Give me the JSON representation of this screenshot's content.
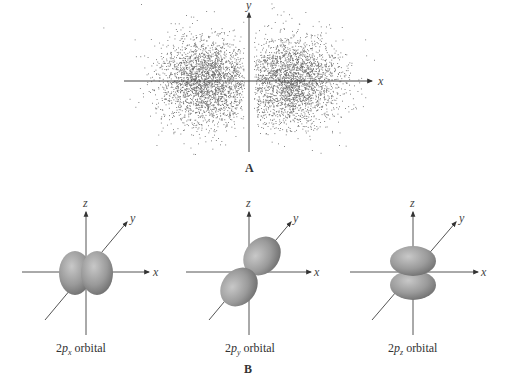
{
  "panel_a": {
    "label": "A",
    "axes": {
      "x": "x",
      "y": "y"
    },
    "description": "Electron density dot plot of a 2p orbital along x-axis"
  },
  "panel_b": {
    "label": "B",
    "orbitals": [
      {
        "name": "2px",
        "caption_prefix": "2",
        "caption_p": "p",
        "caption_sub": "x",
        "caption_suffix": " orbital",
        "axes": {
          "x": "x",
          "y": "y",
          "z": "z"
        }
      },
      {
        "name": "2py",
        "caption_prefix": "2",
        "caption_p": "p",
        "caption_sub": "y",
        "caption_suffix": " orbital",
        "axes": {
          "x": "x",
          "y": "y",
          "z": "z"
        }
      },
      {
        "name": "2pz",
        "caption_prefix": "2",
        "caption_p": "p",
        "caption_sub": "z",
        "caption_suffix": " orbital",
        "axes": {
          "x": "x",
          "y": "y",
          "z": "z"
        }
      }
    ]
  },
  "colors": {
    "axis": "#555555",
    "dots": "#6a6a6a",
    "lobe_light": "#b8b8b8",
    "lobe_dark": "#7a7a7a"
  }
}
